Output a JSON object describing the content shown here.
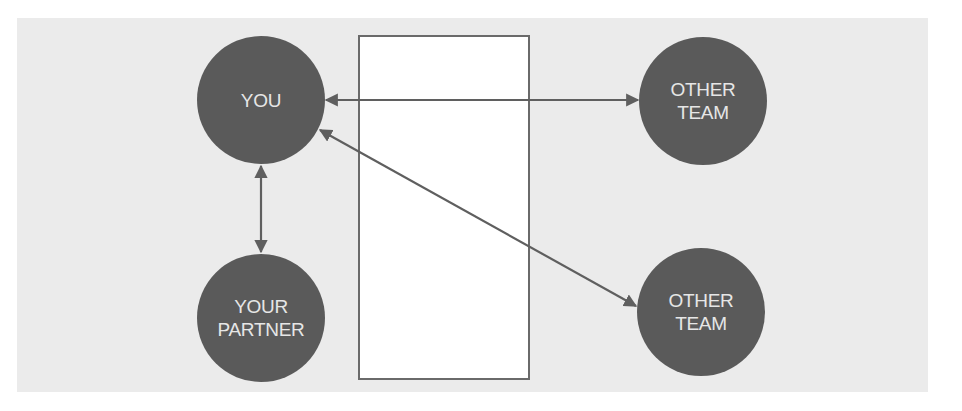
{
  "diagram": {
    "nodes": [
      {
        "id": "you",
        "label": "YOU",
        "cx": 261,
        "cy": 100
      },
      {
        "id": "other-team-top",
        "label": "OTHER\nTEAM",
        "cx": 703,
        "cy": 101
      },
      {
        "id": "your-partner",
        "label": "YOUR\nPARTNER",
        "cx": 261,
        "cy": 318
      },
      {
        "id": "other-team-bottom",
        "label": "OTHER\nTEAM",
        "cx": 701,
        "cy": 312
      }
    ],
    "edges": [
      {
        "from": "you",
        "to": "other-team-top",
        "direction": "bidirectional"
      },
      {
        "from": "you",
        "to": "other-team-bottom",
        "direction": "bidirectional"
      },
      {
        "from": "you",
        "to": "your-partner",
        "direction": "bidirectional"
      }
    ],
    "center_box": {
      "label": ""
    }
  },
  "colors": {
    "panel_background": "#ebebeb",
    "node_fill": "#5a5a5a",
    "node_text": "#e6e6e6",
    "line": "#5f5f5f",
    "box_fill": "#ffffff"
  }
}
